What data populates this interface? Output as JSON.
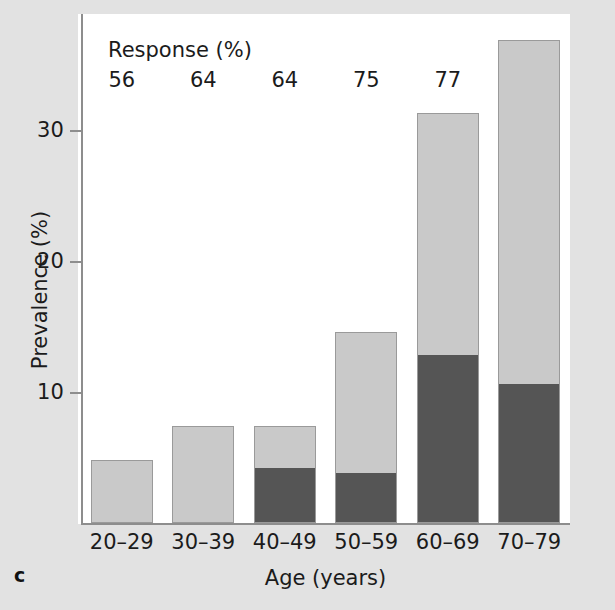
{
  "panel": {
    "letter": "c"
  },
  "chart_data": {
    "type": "bar",
    "subtype": "stacked-bar",
    "title": "",
    "xlabel": "Age (years)",
    "ylabel": "Prevalence (%)",
    "categories": [
      "20–29",
      "30–39",
      "40–49",
      "50–59",
      "60–69",
      "70–79"
    ],
    "series": [
      {
        "name": "dark-segment",
        "color": "#555555",
        "values": [
          0,
          0,
          3.6,
          3.2,
          10.9,
          9.0
        ]
      },
      {
        "name": "light-segment",
        "color": "#c9c9c9",
        "values": [
          4.1,
          6.3,
          2.7,
          9.2,
          15.7,
          22.3
        ]
      }
    ],
    "totals": [
      4.1,
      6.3,
      6.3,
      12.4,
      26.6,
      31.3
    ],
    "ylim": [
      0,
      33
    ],
    "yticks": [
      10,
      20,
      30
    ],
    "ytick_labels": [
      "10",
      "20",
      "30"
    ],
    "grid": false,
    "legend": "none",
    "annotations": {
      "response_title": "Response (%)",
      "response_values": [
        "56",
        "64",
        "64",
        "75",
        "77",
        "60"
      ]
    }
  },
  "colors": {
    "background": "#e2e2e2",
    "plot_background": "#ffffff",
    "light_bar": "#c9c9c9",
    "dark_bar": "#555555",
    "axis": "#8d8d8d",
    "text": "#1b1b1b"
  }
}
